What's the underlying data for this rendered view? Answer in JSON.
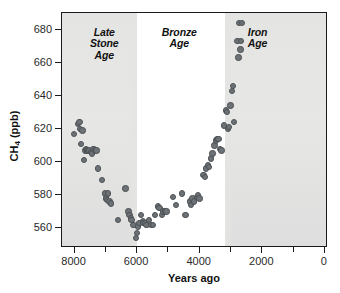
{
  "chart_data": {
    "type": "scatter",
    "title": "",
    "xlabel": "Years ago",
    "ylabel": "CH4 (ppb)",
    "ylabel_display": "CH",
    "ylabel_sub": "4",
    "ylabel_unit": " (ppb)",
    "xlim": [
      8400,
      -100
    ],
    "ylim": [
      548,
      690
    ],
    "x_ticks": [
      8000,
      6000,
      4000,
      2000,
      0
    ],
    "x_tick_labels": [
      "8000",
      "6000",
      "4000",
      "2000",
      "0"
    ],
    "x_minor_ticks": [
      7000,
      5000,
      3000,
      1000
    ],
    "y_ticks": [
      560,
      580,
      600,
      620,
      640,
      660,
      680
    ],
    "y_tick_labels": [
      "560",
      "580",
      "600",
      "620",
      "640",
      "660",
      "680"
    ],
    "grid": false,
    "legend": null,
    "marker_color": "#6d7277",
    "marker_edge_color": "#4c5155",
    "annotations": [
      {
        "text": "Late\nStone\nAge",
        "x": 7050,
        "y": 678,
        "style": "bold-italic"
      },
      {
        "text": "Bronze\nAge",
        "x": 4650,
        "y": 678,
        "style": "bold-italic"
      },
      {
        "text": "Iron\nAge",
        "x": 2150,
        "y": 678,
        "style": "bold-italic"
      }
    ],
    "bands": [
      {
        "name": "Late Stone Age",
        "x_start": 8400,
        "x_end": 6000,
        "shaded": true,
        "color": "#e4e4e2"
      },
      {
        "name": "Bronze Age",
        "x_start": 6000,
        "x_end": 3200,
        "shaded": false,
        "color": "#ffffff"
      },
      {
        "name": "Iron Age",
        "x_start": 3200,
        "x_end": -100,
        "shaded": true,
        "color": "#e4e4e2"
      }
    ],
    "points": [
      [
        8010,
        617
      ],
      [
        7880,
        623
      ],
      [
        7845,
        624
      ],
      [
        7830,
        620
      ],
      [
        7790,
        611
      ],
      [
        7740,
        619
      ],
      [
        7700,
        601
      ],
      [
        7655,
        607
      ],
      [
        7625,
        608
      ],
      [
        7600,
        607
      ],
      [
        7565,
        607
      ],
      [
        7530,
        607
      ],
      [
        7480,
        606
      ],
      [
        7440,
        605
      ],
      [
        7390,
        608
      ],
      [
        7350,
        607
      ],
      [
        7300,
        607
      ],
      [
        7245,
        596
      ],
      [
        7120,
        589
      ],
      [
        7020,
        581
      ],
      [
        6990,
        578
      ],
      [
        6960,
        577
      ],
      [
        6930,
        581
      ],
      [
        6880,
        576
      ],
      [
        6840,
        575
      ],
      [
        6620,
        565
      ],
      [
        6370,
        584
      ],
      [
        6280,
        570
      ],
      [
        6240,
        568
      ],
      [
        6200,
        566
      ],
      [
        6180,
        565
      ],
      [
        6115,
        562
      ],
      [
        6040,
        554
      ],
      [
        6000,
        557
      ],
      [
        5970,
        561
      ],
      [
        5920,
        563
      ],
      [
        5880,
        568
      ],
      [
        5820,
        564
      ],
      [
        5790,
        563
      ],
      [
        5740,
        563
      ],
      [
        5700,
        562
      ],
      [
        5620,
        565
      ],
      [
        5560,
        562
      ],
      [
        5500,
        562
      ],
      [
        5430,
        568
      ],
      [
        5330,
        573
      ],
      [
        5290,
        572
      ],
      [
        5210,
        568
      ],
      [
        5170,
        570
      ],
      [
        5110,
        570
      ],
      [
        5060,
        570
      ],
      [
        4860,
        579
      ],
      [
        4760,
        574
      ],
      [
        4560,
        581
      ],
      [
        4460,
        568
      ],
      [
        4310,
        576
      ],
      [
        4270,
        574
      ],
      [
        4230,
        578
      ],
      [
        4180,
        576
      ],
      [
        4080,
        579
      ],
      [
        4050,
        580
      ],
      [
        4010,
        578
      ],
      [
        3880,
        592
      ],
      [
        3840,
        591
      ],
      [
        3800,
        596
      ],
      [
        3740,
        598
      ],
      [
        3700,
        597
      ],
      [
        3640,
        602
      ],
      [
        3590,
        605
      ],
      [
        3530,
        610
      ],
      [
        3470,
        613
      ],
      [
        3440,
        614
      ],
      [
        3400,
        614
      ],
      [
        3350,
        608
      ],
      [
        3300,
        607
      ],
      [
        3230,
        622
      ],
      [
        3150,
        631
      ],
      [
        3130,
        630
      ],
      [
        3100,
        620
      ],
      [
        3060,
        621
      ],
      [
        3010,
        634
      ],
      [
        2960,
        643
      ],
      [
        2930,
        646
      ],
      [
        2900,
        624
      ],
      [
        2790,
        673
      ],
      [
        2760,
        663
      ],
      [
        2740,
        684
      ],
      [
        2700,
        668
      ],
      [
        2680,
        673
      ],
      [
        2640,
        684
      ]
    ]
  },
  "axis": {
    "x_title": "Years ago"
  }
}
